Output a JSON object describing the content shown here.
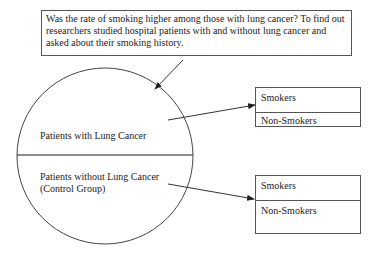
{
  "question": "Was the rate of smoking higher among those with lung cancer? To find out researchers studied hospital patients with and without lung cancer and asked about their smoking history.",
  "circle": {
    "top_label": "Patients with Lung Cancer",
    "bottom_label_line1": "Patients without Lung Cancer",
    "bottom_label_line2": "(Control Group)"
  },
  "cases_box": {
    "row1": "Smokers",
    "row2": "Non-Smokers"
  },
  "control_box": {
    "row1": "Smokers",
    "row2": "Non-Smokers"
  }
}
